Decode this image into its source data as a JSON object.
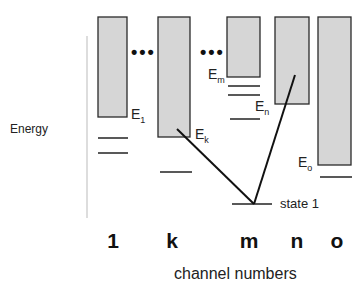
{
  "diagram": {
    "y_axis_label": "Energy",
    "x_axis_label": "channel numbers",
    "ellipsis": "•••",
    "channels": [
      {
        "label": "1",
        "energy_label": "E",
        "energy_sub": "1"
      },
      {
        "label": "k",
        "energy_label": "E",
        "energy_sub": "k"
      },
      {
        "label": "m",
        "energy_label": "E",
        "energy_sub": "m"
      },
      {
        "label": "n",
        "energy_label": "E",
        "energy_sub": "n"
      },
      {
        "label": "o",
        "energy_label": "E",
        "energy_sub": "o"
      }
    ],
    "state_label": "state 1",
    "colors": {
      "continuum_fill": "#d6d6d6",
      "outline": "#2a2a2a",
      "axis_line": "#bbbbbb"
    }
  }
}
